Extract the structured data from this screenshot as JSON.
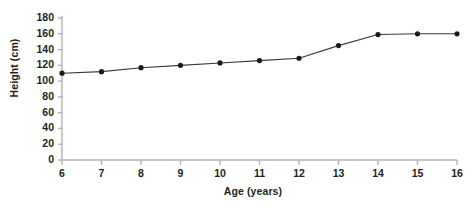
{
  "chart_data": {
    "type": "line",
    "title": "",
    "xlabel": "Age (years)",
    "ylabel": "Height (cm)",
    "x": [
      6,
      7,
      8,
      9,
      10,
      11,
      12,
      13,
      14,
      15,
      16
    ],
    "values": [
      110,
      112,
      117,
      120,
      123,
      126,
      129,
      145,
      159,
      160,
      160
    ],
    "series": [
      {
        "name": "Height",
        "values": [
          110,
          112,
          117,
          120,
          123,
          126,
          129,
          145,
          159,
          160,
          160
        ]
      }
    ],
    "xlim": [
      6,
      16
    ],
    "ylim": [
      0,
      180
    ],
    "xticks": [
      "6",
      "7",
      "8",
      "9",
      "10",
      "11",
      "12",
      "13",
      "14",
      "15",
      "16"
    ],
    "yticks": [
      "0",
      "20",
      "40",
      "60",
      "80",
      "100",
      "120",
      "140",
      "160",
      "180"
    ],
    "grid": false,
    "legend": null,
    "marker": "filled-circle",
    "line_color": "#3a3a3a",
    "marker_color": "#1a1a1a",
    "axis_color": "#b3b3b3"
  }
}
